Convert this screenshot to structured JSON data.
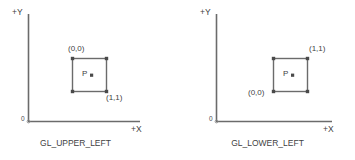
{
  "figure": {
    "line_color": "#6b6b6b",
    "text_color": "#3f3f3f",
    "background": "#ffffff"
  },
  "diagrams": [
    {
      "id": "gl-upper-left",
      "caption": "GL_UPPER_LEFT",
      "axis": {
        "y_label": "+Y",
        "x_label": "+X",
        "origin_label": "0"
      },
      "rect": {
        "top_corner_label": "(0,0)",
        "bottom_corner_label": "(1,1)",
        "point_label": "P"
      }
    },
    {
      "id": "gl-lower-left",
      "caption": "GL_LOWER_LEFT",
      "axis": {
        "y_label": "+Y",
        "x_label": "+X",
        "origin_label": "0"
      },
      "rect": {
        "top_corner_label": "(1,1)",
        "bottom_corner_label": "(0,0)",
        "point_label": "P"
      }
    }
  ]
}
